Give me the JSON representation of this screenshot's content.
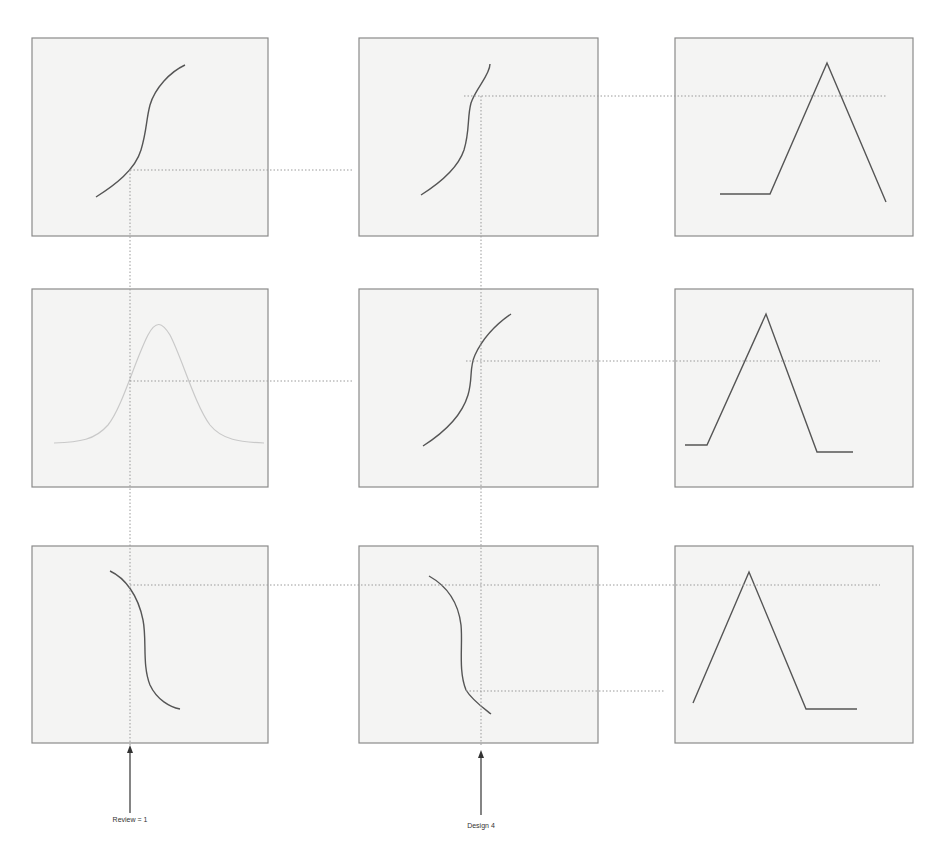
{
  "diagram": {
    "type": "projection grid of 3x3 response plots",
    "rows": [
      {
        "panels": [
          {
            "name": "s-curve-rising",
            "description": "rising S-shaped curve"
          },
          {
            "name": "s-curve-rising",
            "description": "rising S-shaped curve"
          },
          {
            "name": "triangle-peak",
            "description": "flat segment, rise to peak, fall"
          }
        ]
      },
      {
        "panels": [
          {
            "name": "bell-curve",
            "description": "faint gaussian bell curve"
          },
          {
            "name": "s-curve-rising",
            "description": "rising S-shaped curve"
          },
          {
            "name": "triangle-peak",
            "description": "flat, rise to peak, fall, flat"
          }
        ]
      },
      {
        "panels": [
          {
            "name": "s-curve-falling",
            "description": "falling S-shaped curve"
          },
          {
            "name": "s-curve-falling",
            "description": "falling S-shaped curve"
          },
          {
            "name": "triangle-peak",
            "description": "rise to peak, fall, flat"
          }
        ]
      }
    ],
    "markers": [
      {
        "label": "Review = 1",
        "x": 130
      },
      {
        "label": "Design 4",
        "x": 481
      }
    ],
    "colors": {
      "panel_fill": "#f4f4f3",
      "panel_border": "#8a8a8a",
      "curve": "#555555",
      "guide": "#9a9a9a"
    }
  }
}
